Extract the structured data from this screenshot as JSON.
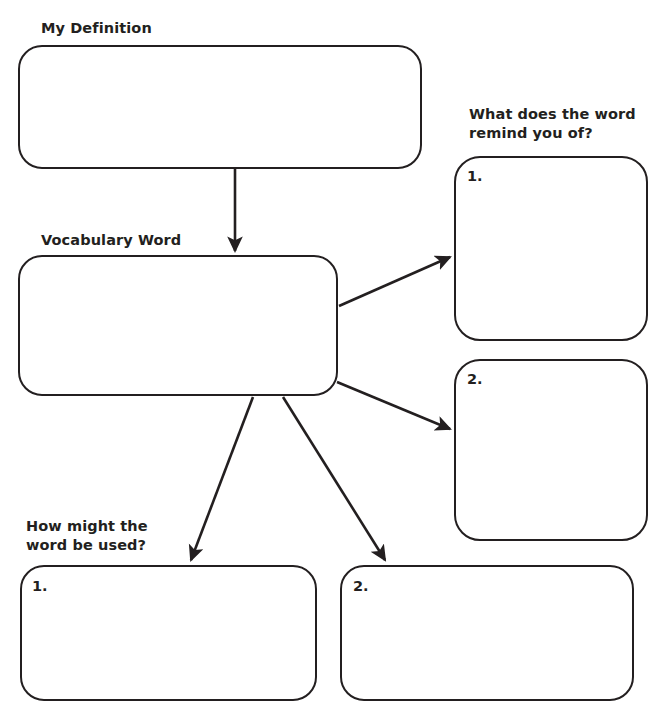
{
  "page": {
    "background_color": "#ffffff",
    "ink_color": "#231f20",
    "width": 666,
    "height": 716
  },
  "labels": {
    "definition": "My Definition",
    "vocabulary": "Vocabulary Word",
    "remind": "What does the word\nremind you of?",
    "used": "How might the\nword be used?"
  },
  "boxes": {
    "definition": {
      "value": "",
      "placeholder": ""
    },
    "vocabulary": {
      "value": "",
      "placeholder": ""
    },
    "remind_1": {
      "number": "1.",
      "value": "",
      "placeholder": ""
    },
    "remind_2": {
      "number": "2.",
      "value": "",
      "placeholder": ""
    },
    "used_1": {
      "number": "1.",
      "value": "",
      "placeholder": ""
    },
    "used_2": {
      "number": "2.",
      "value": "",
      "placeholder": ""
    }
  },
  "connectors": [
    {
      "name": "definition-to-vocabulary",
      "from": [
        235,
        169
      ],
      "to": [
        235,
        253
      ]
    },
    {
      "name": "vocabulary-to-remind-1",
      "from": [
        339,
        306
      ],
      "to": [
        452,
        256
      ]
    },
    {
      "name": "vocabulary-to-remind-2",
      "from": [
        337,
        382
      ],
      "to": [
        452,
        431
      ]
    },
    {
      "name": "vocabulary-to-used-1",
      "from": [
        253,
        397
      ],
      "to": [
        190,
        562
      ]
    },
    {
      "name": "vocabulary-to-used-2",
      "from": [
        283,
        397
      ],
      "to": [
        386,
        562
      ]
    }
  ]
}
